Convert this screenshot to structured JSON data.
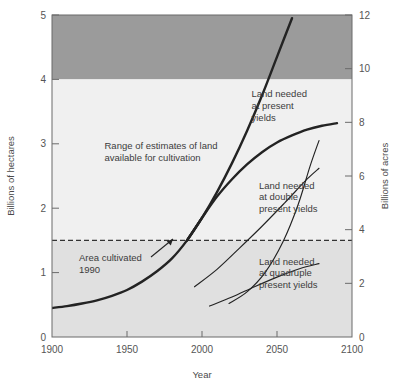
{
  "chart_data": {
    "type": "line",
    "title": "",
    "xlabel": "Year",
    "ylabel_left": "Billions of hectares",
    "ylabel_right": "Billions of acres",
    "xlim": [
      1900,
      2100
    ],
    "ylim_left": [
      0,
      5
    ],
    "ylim_right": [
      0,
      12
    ],
    "xticks": [
      1900,
      1950,
      2000,
      2050,
      2100
    ],
    "xtick_labels": [
      "1900",
      "1950",
      "2000",
      "2050",
      "2100"
    ],
    "yticks_left": [
      0,
      1,
      2,
      3,
      4,
      5
    ],
    "ytick_labels_left": [
      "0",
      "1",
      "2",
      "3",
      "4",
      "5"
    ],
    "yticks_right": [
      0,
      2,
      4,
      6,
      8,
      10,
      12
    ],
    "ytick_labels_right": [
      "0",
      "2",
      "4",
      "6",
      "8",
      "10",
      "12"
    ],
    "grid": false,
    "legend_position": "inline-annotations",
    "bands": [
      {
        "name": "upper-estimate-band",
        "label": "Range of estimates of land available for cultivation (upper)",
        "y_from": 4.0,
        "y_to": 5.0,
        "color": "#9b9b9b"
      },
      {
        "name": "estimate-band-mid",
        "label": "Range of estimates of land available for cultivation",
        "y_from": 1.5,
        "y_to": 4.0,
        "color": "#f0f0f0"
      },
      {
        "name": "cultivated-band",
        "label": "Below area cultivated 1990",
        "y_from": 0.0,
        "y_to": 1.5,
        "color": "#e0e0e0"
      }
    ],
    "reference_lines": [
      {
        "name": "area-cultivated-1990",
        "label": "Area cultivated 1990",
        "y": 1.5,
        "style": "dashed",
        "color": "#333333"
      }
    ],
    "series": [
      {
        "name": "historic-cultivated-area",
        "label": "Historic cultivated area",
        "style": "thick",
        "x": [
          1900,
          1910,
          1920,
          1930,
          1940,
          1950,
          1960,
          1970,
          1980,
          1990,
          2000
        ],
        "y": [
          0.45,
          0.48,
          0.52,
          0.57,
          0.64,
          0.73,
          0.86,
          1.02,
          1.22,
          1.5,
          1.85
        ]
      },
      {
        "name": "land-needed-present-yields",
        "label": "Land needed at present yields",
        "style": "thick",
        "x": [
          1990,
          2000,
          2010,
          2020,
          2030,
          2040,
          2050,
          2060
        ],
        "y": [
          1.5,
          1.85,
          2.25,
          2.7,
          3.2,
          3.75,
          4.35,
          4.95
        ]
      },
      {
        "name": "land-needed-double-yields-upper",
        "label": "Land needed at double present yields (upper)",
        "style": "thick",
        "x": [
          1990,
          2000,
          2010,
          2020,
          2030,
          2040,
          2050,
          2060,
          2070,
          2080,
          2090
        ],
        "y": [
          1.5,
          1.85,
          2.18,
          2.45,
          2.68,
          2.87,
          3.02,
          3.13,
          3.22,
          3.28,
          3.32
        ]
      },
      {
        "name": "land-needed-double-yields-lower",
        "label": "Land needed at double present yields (lower)",
        "style": "thin",
        "x": [
          1995,
          2010,
          2025,
          2040,
          2055,
          2070,
          2078
        ],
        "y": [
          0.78,
          1.05,
          1.38,
          1.72,
          2.08,
          2.45,
          2.62
        ]
      },
      {
        "name": "land-needed-quadruple-yields-upper",
        "label": "Land needed at quadruple present yields (upper)",
        "style": "thin",
        "x": [
          2018,
          2030,
          2042,
          2054,
          2064,
          2072,
          2078
        ],
        "y": [
          0.52,
          0.7,
          1.0,
          1.48,
          2.05,
          2.65,
          3.05
        ]
      },
      {
        "name": "land-needed-quadruple-yields-lower",
        "label": "Land needed at quadruple present yields (lower)",
        "style": "thin",
        "x": [
          2005,
          2020,
          2035,
          2050,
          2065,
          2078
        ],
        "y": [
          0.48,
          0.62,
          0.78,
          0.93,
          1.06,
          1.14
        ]
      }
    ],
    "annotations": [
      {
        "name": "range-of-estimates",
        "text_lines": [
          "Range of estimates  of land",
          "available for cultivation"
        ],
        "x": 1935,
        "y": 2.92
      },
      {
        "name": "area-cultivated-1990",
        "text_lines": [
          "Area cultivated",
          "1990"
        ],
        "x": 1918,
        "y": 1.18,
        "has_arrow": true
      },
      {
        "name": "land-needed-present-yields",
        "text_lines": [
          "Land needed",
          "at present",
          "yields"
        ],
        "x": 2033,
        "y": 3.72
      },
      {
        "name": "land-needed-double-present-yields",
        "text_lines": [
          "Land needed",
          "at double",
          "present yields"
        ],
        "x": 2038,
        "y": 2.3
      },
      {
        "name": "land-needed-quadruple-present-yields",
        "text_lines": [
          "Land needed",
          "at quadruple",
          "present yields"
        ],
        "x": 2038,
        "y": 1.12
      }
    ],
    "colors": {
      "band_dark": "#9b9b9b",
      "band_light": "#f0f0f0",
      "band_mid": "#e0e0e0",
      "line": "#232323",
      "axis": "#6b6b6b",
      "text": "#4a4a4a"
    }
  }
}
